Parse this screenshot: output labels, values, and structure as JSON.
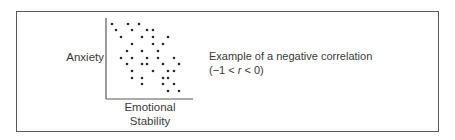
{
  "figure": {
    "y_axis_label": "Anxiety",
    "x_axis_label_line1": "Emotional",
    "x_axis_label_line2": "Stability",
    "caption_line1": "Example of a negative correlation",
    "caption_line2_prefix": "(−1 < ",
    "caption_line2_var": "r",
    "caption_line2_suffix": " < 0)",
    "colors": {
      "border": "#5a5a5a",
      "axis": "#5a5a5a",
      "dot": "#2a2a2a",
      "text": "#3a3a3a"
    }
  },
  "chart_data": {
    "type": "scatter",
    "title": "Example of a negative correlation (−1 < r < 0)",
    "xlabel": "Emotional Stability",
    "ylabel": "Anxiety",
    "grid": false,
    "ticks": false,
    "note": "Coordinates are relative positions (x: 0=axis left, 1=axis right; y: 0=bottom, 1=top); no numeric scale shown.",
    "points": [
      [
        0.08,
        0.93
      ],
      [
        0.26,
        0.93
      ],
      [
        0.38,
        0.93
      ],
      [
        0.12,
        0.85
      ],
      [
        0.3,
        0.85
      ],
      [
        0.47,
        0.85
      ],
      [
        0.54,
        0.85
      ],
      [
        0.17,
        0.77
      ],
      [
        0.41,
        0.77
      ],
      [
        0.54,
        0.77
      ],
      [
        0.71,
        0.77
      ],
      [
        0.3,
        0.68
      ],
      [
        0.54,
        0.68
      ],
      [
        0.65,
        0.68
      ],
      [
        0.24,
        0.59
      ],
      [
        0.41,
        0.59
      ],
      [
        0.6,
        0.59
      ],
      [
        0.17,
        0.51
      ],
      [
        0.3,
        0.51
      ],
      [
        0.47,
        0.51
      ],
      [
        0.6,
        0.51
      ],
      [
        0.78,
        0.51
      ],
      [
        0.24,
        0.43
      ],
      [
        0.41,
        0.43
      ],
      [
        0.47,
        0.43
      ],
      [
        0.65,
        0.43
      ],
      [
        0.84,
        0.43
      ],
      [
        0.3,
        0.35
      ],
      [
        0.54,
        0.35
      ],
      [
        0.71,
        0.35
      ],
      [
        0.78,
        0.35
      ],
      [
        0.3,
        0.26
      ],
      [
        0.41,
        0.26
      ],
      [
        0.65,
        0.26
      ],
      [
        0.71,
        0.26
      ],
      [
        0.41,
        0.19
      ],
      [
        0.65,
        0.19
      ],
      [
        0.78,
        0.19
      ],
      [
        0.71,
        0.1
      ],
      [
        0.84,
        0.1
      ]
    ],
    "pixel_points": [
      [
        112,
        24
      ],
      [
        128,
        24
      ],
      [
        139,
        24
      ],
      [
        116,
        30
      ],
      [
        132,
        30
      ],
      [
        147,
        30
      ],
      [
        153,
        30
      ],
      [
        121,
        37
      ],
      [
        142,
        37
      ],
      [
        153,
        37
      ],
      [
        168,
        37
      ],
      [
        132,
        44
      ],
      [
        153,
        44
      ],
      [
        163,
        44
      ],
      [
        127,
        51
      ],
      [
        142,
        51
      ],
      [
        158,
        51
      ],
      [
        121,
        58
      ],
      [
        132,
        58
      ],
      [
        147,
        58
      ],
      [
        158,
        58
      ],
      [
        174,
        58
      ],
      [
        127,
        64
      ],
      [
        142,
        64
      ],
      [
        147,
        64
      ],
      [
        163,
        64
      ],
      [
        179,
        64
      ],
      [
        132,
        71
      ],
      [
        153,
        71
      ],
      [
        168,
        71
      ],
      [
        174,
        71
      ],
      [
        132,
        78
      ],
      [
        142,
        78
      ],
      [
        163,
        78
      ],
      [
        168,
        78
      ],
      [
        142,
        84
      ],
      [
        163,
        84
      ],
      [
        174,
        84
      ],
      [
        168,
        91
      ],
      [
        179,
        91
      ]
    ],
    "axes": {
      "x0": 106,
      "x1": 193,
      "y_top": 18,
      "y_bottom": 99
    }
  }
}
